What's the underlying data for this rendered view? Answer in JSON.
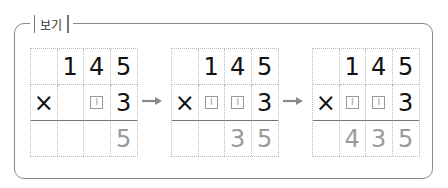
{
  "label": "보기",
  "examples": [
    {
      "rows": [
        [
          "",
          "1",
          "4",
          "5"
        ],
        [
          "×",
          "",
          "□",
          "3"
        ],
        [
          "",
          "",
          "",
          "5"
        ]
      ]
    },
    {
      "rows": [
        [
          "",
          "1",
          "4",
          "5"
        ],
        [
          "×",
          "□",
          "□",
          "3"
        ],
        [
          "",
          "",
          "3",
          "5"
        ]
      ]
    },
    {
      "rows": [
        [
          "",
          "1",
          "4",
          "5"
        ],
        [
          "×",
          "□",
          "□",
          "3"
        ],
        [
          "",
          "4",
          "3",
          "5"
        ]
      ]
    }
  ],
  "placeholder_mark": "I",
  "arrow": "→",
  "colors": {
    "result_digit": "#9a9a9a",
    "text": "#111111",
    "border": "#8a8a8a"
  }
}
